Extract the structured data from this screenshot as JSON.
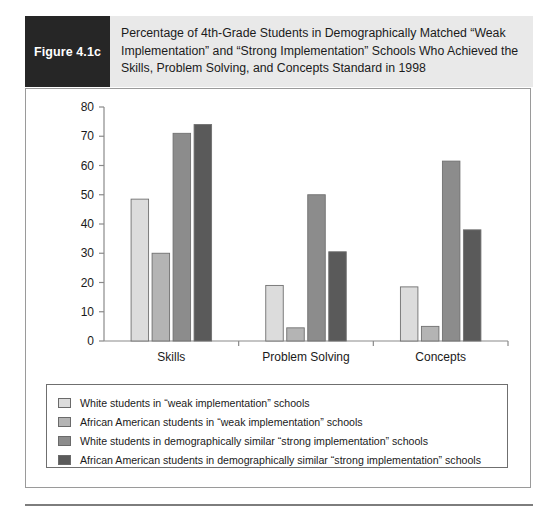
{
  "figure": {
    "tag_label": "Figure 4.1c",
    "title": "Percentage of 4th-Grade Students in Demographically Matched “Weak Implementation” and “Strong Implementation” Schools Who Achieved the Skills, Problem Solving, and Concepts Standard in 1998"
  },
  "chart_data": {
    "type": "bar",
    "title": "",
    "xlabel": "",
    "ylabel": "",
    "ylim": [
      0,
      80
    ],
    "yticks": [
      0,
      10,
      20,
      30,
      40,
      50,
      60,
      70,
      80
    ],
    "ytick_labels": [
      "0",
      "10",
      "20",
      "30",
      "40",
      "50",
      "60",
      "70",
      "80"
    ],
    "grid": false,
    "legend_position": "below-plot",
    "categories": [
      "Skills",
      "Problem Solving",
      "Concepts"
    ],
    "series": [
      {
        "name": "White students in “weak implementation” schools",
        "color": "#dcdcdc",
        "values": [
          48.5,
          19,
          18.5
        ]
      },
      {
        "name": "African American students in “weak implementation” schools",
        "color": "#b4b4b4",
        "values": [
          30,
          4.5,
          5
        ]
      },
      {
        "name": "White students in demographically similar “strong implementation” schools",
        "color": "#8c8c8c",
        "values": [
          71,
          50,
          61.5
        ]
      },
      {
        "name": "African American students in demographically similar “strong implementation” schools",
        "color": "#5a5a5a",
        "values": [
          74,
          30.5,
          38
        ]
      }
    ]
  },
  "colors": {
    "tag_background": "#262626",
    "header_background": "#e9e9e9",
    "axis": "#8a8a8a",
    "border": "#9a9a9a",
    "text": "#1a1a1a"
  }
}
